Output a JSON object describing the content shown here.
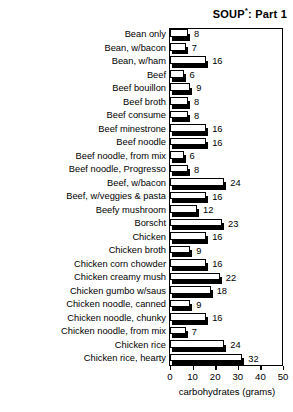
{
  "chart_data": {
    "type": "bar",
    "orientation": "horizontal",
    "title": "SOUP*: Part 1",
    "title_main": "SOUP",
    "title_superscript": "*",
    "title_suffix": ": Part 1",
    "xlabel": "carbohydrates (grams)",
    "ylabel": "",
    "xlim": [
      0,
      50
    ],
    "xticks": [
      0,
      10,
      20,
      30,
      40,
      50
    ],
    "xtick_labels": [
      "0",
      "10",
      "20",
      "30",
      "40",
      "50"
    ],
    "grid": false,
    "legend": null,
    "categories": [
      "Bean only",
      "Bean, w/bacon",
      "Bean, w/ham",
      "Beef",
      "Beef bouillon",
      "Beef broth",
      "Beef consume",
      "Beef minestrone",
      "Beef noodle",
      "Beef noodle, from mix",
      "Beef noodle, Progresso",
      "Beef, w/bacon",
      "Beef, w/veggies & pasta",
      "Beefy mushroom",
      "Borscht",
      "Chicken",
      "Chicken broth",
      "Chicken corn chowder",
      "Chicken creamy mush",
      "Chicken gumbo w/saus",
      "Chicken noodle, canned",
      "Chicken noodle, chunky",
      "Chicken noodle, from mix",
      "Chicken rice",
      "Chicken rice, hearty"
    ],
    "values": [
      8,
      7,
      16,
      6,
      9,
      8,
      8,
      16,
      16,
      6,
      8,
      24,
      16,
      12,
      23,
      16,
      9,
      16,
      22,
      18,
      9,
      16,
      7,
      24,
      32
    ],
    "value_labels": [
      "8",
      "7",
      "16",
      "6",
      "9",
      "8",
      "8",
      "16",
      "16",
      "6",
      "8",
      "24",
      "16",
      "12",
      "23",
      "16",
      "9",
      "16",
      "22",
      "18",
      "9",
      "16",
      "7",
      "24",
      "32"
    ]
  }
}
